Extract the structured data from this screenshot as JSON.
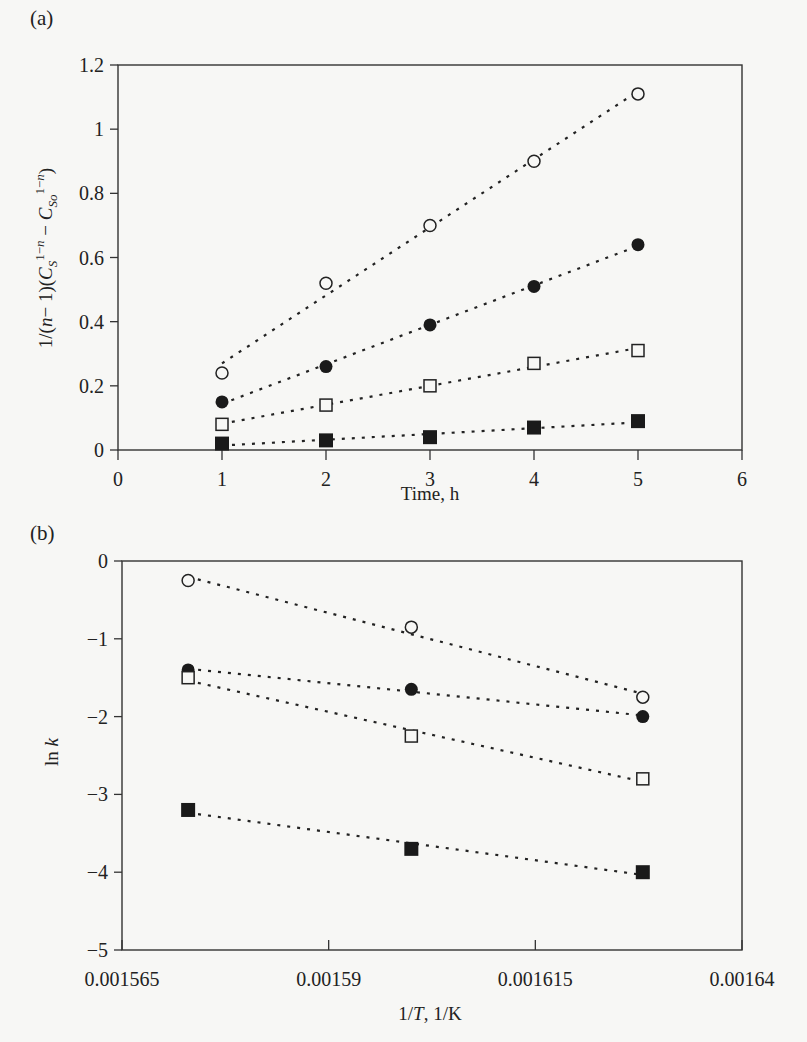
{
  "chart_data": [
    {
      "panel": "(a)",
      "type": "scatter",
      "title": "",
      "xlabel": "Time, h",
      "ylabel": "1/(n−1)(C_S^(1−n) − C_So^(1−n))",
      "xlim": [
        0,
        6
      ],
      "ylim": [
        0,
        1.2
      ],
      "x_ticks": [
        "0",
        "1",
        "2",
        "3",
        "4",
        "5",
        "6"
      ],
      "y_ticks": [
        "0",
        "0.2",
        "0.4",
        "0.6",
        "0.8",
        "1",
        "1.2"
      ],
      "grid": false,
      "legend": "none",
      "x": [
        1,
        2,
        3,
        4,
        5
      ],
      "series": [
        {
          "name": "open-circle",
          "marker": "open-circle",
          "values": [
            0.24,
            0.52,
            0.7,
            0.9,
            1.11
          ]
        },
        {
          "name": "filled-circle",
          "marker": "filled-circle",
          "values": [
            0.15,
            0.26,
            0.39,
            0.51,
            0.64
          ]
        },
        {
          "name": "open-square",
          "marker": "open-square",
          "values": [
            0.08,
            0.14,
            0.2,
            0.27,
            0.31
          ]
        },
        {
          "name": "filled-square",
          "marker": "filled-square",
          "values": [
            0.02,
            0.03,
            0.04,
            0.07,
            0.09
          ]
        }
      ],
      "fit_lines": "dotted linear fits through each series"
    },
    {
      "panel": "(b)",
      "type": "scatter",
      "title": "",
      "xlabel": "1/T, 1/K",
      "ylabel": "ln k",
      "xlim": [
        0.001565,
        0.00164
      ],
      "ylim": [
        -5,
        0
      ],
      "x_ticks": [
        "0.001565",
        "0.00159",
        "0.001615",
        "0.00164"
      ],
      "y_ticks": [
        "0",
        "−1",
        "−2",
        "−3",
        "−4",
        "−5"
      ],
      "grid": false,
      "legend": "none",
      "x": [
        0.001573,
        0.0016,
        0.001628
      ],
      "series": [
        {
          "name": "open-circle",
          "marker": "open-circle",
          "values": [
            -0.25,
            -0.85,
            -1.75
          ]
        },
        {
          "name": "filled-circle",
          "marker": "filled-circle",
          "values": [
            -1.4,
            -1.65,
            -2.0
          ]
        },
        {
          "name": "open-square",
          "marker": "open-square",
          "values": [
            -1.5,
            -2.25,
            -2.8
          ]
        },
        {
          "name": "filled-square",
          "marker": "filled-square",
          "values": [
            -3.2,
            -3.7,
            -4.0
          ]
        }
      ],
      "fit_lines": "dotted linear fits through each series"
    }
  ],
  "labels": {
    "panel_a": "(a)",
    "panel_b": "(b)",
    "a_xlabel": "Time, h",
    "b_xlabel": "1/T, 1/K",
    "b_ylabel": "ln k"
  }
}
